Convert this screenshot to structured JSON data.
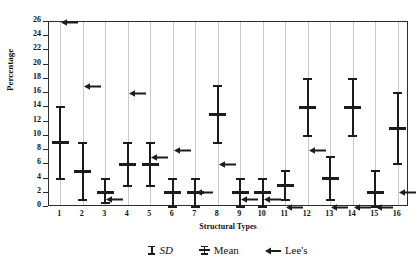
{
  "chart_data": {
    "type": "scatter",
    "title": "",
    "xlabel": "Structural Types",
    "ylabel": "Percentage",
    "categories": [
      "1",
      "2",
      "3",
      "4",
      "5",
      "6",
      "7",
      "8",
      "9",
      "10",
      "11",
      "12",
      "13",
      "14",
      "15",
      "16"
    ],
    "ylim": [
      0,
      26
    ],
    "ytick_labels": [
      "0",
      "2",
      "4",
      "6",
      "8",
      "10",
      "12",
      "14",
      "16",
      "18",
      "20",
      "22",
      "24",
      "26"
    ],
    "ytick_values": [
      0,
      2,
      4,
      6,
      8,
      10,
      12,
      14,
      16,
      18,
      20,
      22,
      24,
      26
    ],
    "xlim": [
      0.5,
      16.5
    ],
    "grid": "vertical",
    "legend_position": "below-axis",
    "series": [
      {
        "name": "Mean",
        "marker": "mean-bar",
        "values": [
          9,
          5,
          2,
          6,
          6,
          2,
          2,
          13,
          2,
          2,
          3,
          14,
          4,
          14,
          2,
          11
        ]
      },
      {
        "name": "SD",
        "marker": "error-bar",
        "upper": [
          14,
          9,
          4,
          9,
          9,
          4,
          4,
          17,
          4,
          4,
          5,
          18,
          7,
          18,
          5,
          16
        ],
        "lower": [
          4,
          1,
          0.5,
          3,
          3,
          0,
          0,
          9,
          0,
          0,
          1,
          10,
          1,
          10,
          0,
          6
        ]
      },
      {
        "name": "Lee's",
        "marker": "left-arrow",
        "values": [
          26,
          17,
          1,
          16,
          7,
          8,
          2,
          6,
          1,
          1,
          0,
          8,
          0,
          0,
          0,
          2
        ]
      }
    ],
    "legend": [
      {
        "label": "SD",
        "glyph": "sd-errorbar-icon",
        "italic": true
      },
      {
        "label": "Mean",
        "glyph": "mean-bar-icon",
        "italic": false
      },
      {
        "label": "Lee's",
        "glyph": "left-arrow-icon",
        "italic": false
      }
    ],
    "colors": {
      "marks": "#1c1c1c",
      "gridlines": "#c9c9c9",
      "axis": "#2b2b2b",
      "background": "#ffffff"
    }
  }
}
